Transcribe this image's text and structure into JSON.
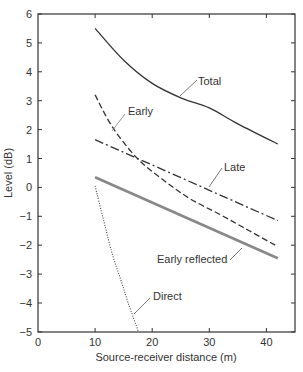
{
  "chart_data": {
    "type": "line",
    "title": "",
    "xlabel": "Source-receiver distance (m)",
    "ylabel": "Level (dB)",
    "xlim": [
      0,
      45
    ],
    "ylim": [
      -5,
      6
    ],
    "x_ticks": [
      0,
      10,
      20,
      30,
      40
    ],
    "y_ticks": [
      6,
      5,
      4,
      3,
      2,
      1,
      0,
      -1,
      -2,
      -3,
      -4,
      -5
    ],
    "grid": false,
    "legend": "inline labels with leader lines",
    "series": [
      {
        "name": "Total",
        "style": "solid",
        "x": [
          10,
          15,
          20,
          25,
          30,
          35,
          42
        ],
        "values": [
          5.5,
          4.4,
          3.6,
          3.1,
          2.75,
          2.2,
          1.5
        ]
      },
      {
        "name": "Early",
        "style": "dashed",
        "x": [
          10,
          13,
          17.4,
          22,
          26.7,
          32,
          37,
          42
        ],
        "values": [
          3.2,
          2.1,
          1.0,
          0.25,
          -0.4,
          -0.95,
          -1.5,
          -2.05
        ]
      },
      {
        "name": "Late",
        "style": "dash-dot",
        "x": [
          10,
          42
        ],
        "values": [
          1.65,
          -1.15
        ]
      },
      {
        "name": "Early reflected",
        "style": "double solid (gray)",
        "x": [
          10,
          42
        ],
        "values": [
          0.35,
          -2.45
        ]
      },
      {
        "name": "Direct",
        "style": "dotted",
        "x": [
          10,
          11.5,
          13,
          14.5,
          15.8,
          17.6
        ],
        "values": [
          0.05,
          -1.15,
          -2.3,
          -3.2,
          -4.0,
          -5.0
        ]
      }
    ]
  },
  "labels": {
    "total": "Total",
    "early": "Early",
    "late": "Late",
    "early_reflected": "Early reflected",
    "direct": "Direct",
    "xlabel": "Source-receiver distance (m)",
    "ylabel": "Level (dB)",
    "xticks": [
      "0",
      "10",
      "20",
      "30",
      "40"
    ],
    "yticks": [
      "6",
      "5",
      "4",
      "3",
      "2",
      "1",
      "0",
      "−1",
      "−2",
      "−3",
      "−4",
      "−5"
    ]
  }
}
